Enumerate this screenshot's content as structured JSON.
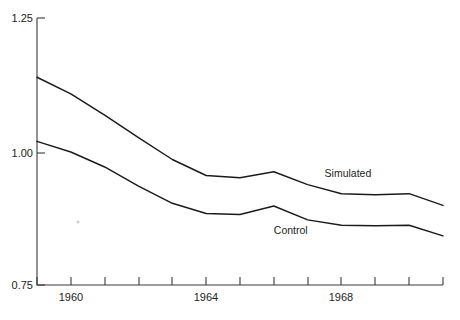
{
  "chart_data": {
    "type": "line",
    "title": "",
    "subtitle": "",
    "xlabel": "",
    "ylabel": "",
    "xlim": [
      1959,
      1971
    ],
    "ylim": [
      0.75,
      1.25
    ],
    "grid": false,
    "legend_position": "inline-annotation",
    "y_ticks": [
      "1.25",
      "1.00",
      "0.75"
    ],
    "y_tick_values": [
      1.25,
      1.0,
      0.75
    ],
    "x_ticks": [
      "1960",
      "1964",
      "1968"
    ],
    "x_tick_values": [
      1960,
      1964,
      1968
    ],
    "x_all_tick_values": [
      1959,
      1960,
      1961,
      1962,
      1963,
      1964,
      1965,
      1966,
      1967,
      1968,
      1969,
      1970,
      1971
    ],
    "x": [
      1959,
      1960,
      1961,
      1962,
      1963,
      1964,
      1965,
      1966,
      1967,
      1968,
      1969,
      1970,
      1971
    ],
    "series": [
      {
        "name": "Simulated",
        "label": "Simulated",
        "color": "#1b1b1b",
        "values": [
          1.139,
          1.108,
          1.068,
          1.026,
          0.985,
          0.955,
          0.951,
          0.962,
          0.938,
          0.921,
          0.919,
          0.921,
          0.899
        ]
      },
      {
        "name": "Control",
        "label": "Control",
        "color": "#1b1b1b",
        "values": [
          1.019,
          0.999,
          0.971,
          0.935,
          0.903,
          0.884,
          0.882,
          0.898,
          0.872,
          0.862,
          0.861,
          0.862,
          0.842
        ]
      }
    ],
    "annotations": [
      {
        "text": "Simulated",
        "x": 1967.5,
        "y": 0.952
      },
      {
        "text": "Control",
        "x": 1966.0,
        "y": 0.845
      }
    ]
  },
  "axes": {
    "y_axis_name": "value-axis",
    "x_axis_name": "year-axis"
  }
}
